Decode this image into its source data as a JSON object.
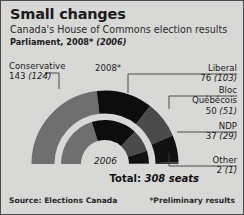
{
  "header": {
    "title": "Small changes",
    "subtitle": "Canada's House of Commons election results",
    "parliament_prefix": "Parliament, 2008*",
    "parliament_prev": "(2006)"
  },
  "chart_labels": {
    "outer_ring": "2008*",
    "inner_ring": "2006",
    "total": "Total:",
    "total_value": "308 seats"
  },
  "footer": {
    "source": "Source: Elections Canada",
    "preliminary": "*Preliminary results"
  },
  "parties": [
    {
      "name": "Conservative",
      "seats_2008": "143",
      "seats_2006": "(124)",
      "color": "#6f6f6f"
    },
    {
      "name": "Liberal",
      "seats_2008": "76",
      "seats_2006": "(103)",
      "color": "#0d0d0d"
    },
    {
      "name": "Bloc",
      "name2": "Québécois",
      "seats_2008": "50",
      "seats_2006": "(51)",
      "color": "#4a4a4a"
    },
    {
      "name": "NDP",
      "seats_2008": "37",
      "seats_2006": "(29)",
      "color": "#111111"
    },
    {
      "name": "Other",
      "seats_2008": "2",
      "seats_2006": "(1)",
      "color": "#3a3a3a"
    }
  ],
  "chart_data": {
    "type": "pie",
    "title": "Canada's House of Commons election results",
    "subtype": "nested-semicircle-parliament",
    "total_seats": 308,
    "legend_position": "outside-left-right",
    "series": [
      {
        "name": "2008*",
        "ring": "outer",
        "categories": [
          "Conservative",
          "Liberal",
          "Bloc Québécois",
          "NDP",
          "Other"
        ],
        "values": [
          143,
          76,
          50,
          37,
          2
        ]
      },
      {
        "name": "2006",
        "ring": "inner",
        "categories": [
          "Conservative",
          "Liberal",
          "Bloc Québécois",
          "NDP",
          "Other"
        ],
        "values": [
          124,
          103,
          51,
          29,
          1
        ]
      }
    ],
    "colors": [
      "#6f6f6f",
      "#0d0d0d",
      "#4a4a4a",
      "#111111",
      "#3a3a3a"
    ],
    "grid": false
  },
  "colors": {
    "background": "#d8d8d6",
    "border": "#4a4a4a",
    "text": "#1a1a1a",
    "leader_line": "#3a3a3a"
  }
}
